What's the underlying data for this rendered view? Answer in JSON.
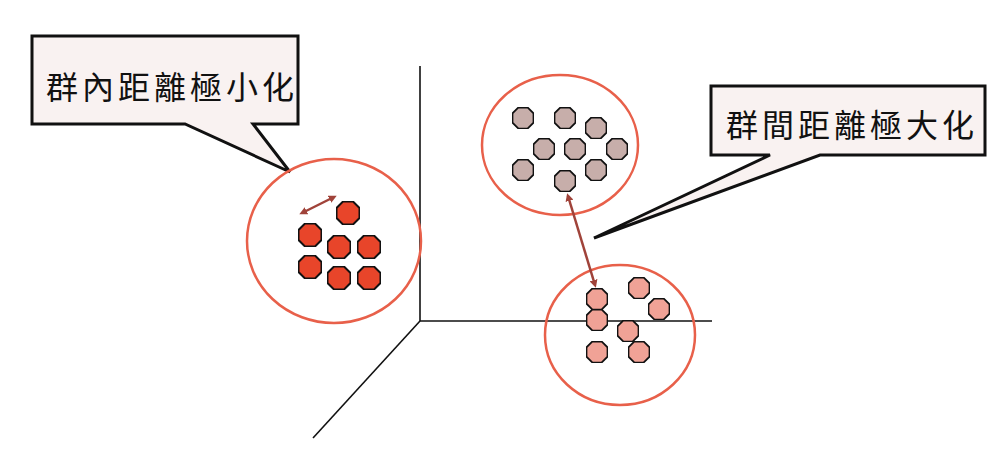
{
  "diagram": {
    "type": "clustering-concept",
    "callouts": [
      {
        "id": "intra",
        "label": "群內距離極小化"
      },
      {
        "id": "inter",
        "label": "群間距離極大化"
      }
    ],
    "colors": {
      "cluster_circle": "#e8604a",
      "cluster_left_fill": "#e8452a",
      "cluster_top_fill": "#c7aeaa",
      "cluster_bottom_fill": "#f0a296",
      "arrow": "#a0433a",
      "callout_fill": "#f9f2f1",
      "outline": "#111111"
    },
    "clusters": [
      {
        "name": "left",
        "points": 7
      },
      {
        "name": "top",
        "points": 9
      },
      {
        "name": "bottom",
        "points": 7
      }
    ]
  }
}
